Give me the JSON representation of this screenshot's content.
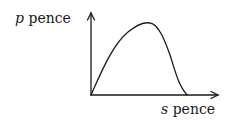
{
  "diagram": {
    "y_axis": {
      "variable": "p",
      "unit": "pence"
    },
    "x_axis": {
      "variable": "s",
      "unit": "pence"
    },
    "curve": "hump-shaped curve starting at origin, rising to a maximum, then falling back to the s-axis"
  },
  "colors": {
    "ink": "#1a1a1a",
    "background": "#ffffff"
  }
}
